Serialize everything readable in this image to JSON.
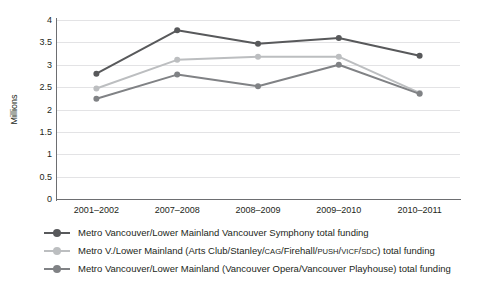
{
  "chart_data": {
    "type": "line",
    "title": "",
    "xlabel": "",
    "ylabel": "Millions",
    "ylim": [
      0,
      4
    ],
    "ytick_values": [
      4,
      3.5,
      3,
      2.5,
      2,
      1.5,
      1,
      0.5,
      0
    ],
    "ytick_labels": [
      "4",
      "3.5",
      "3",
      "2.5",
      "2",
      "1.5",
      "1",
      "0.5",
      "0"
    ],
    "grid": true,
    "legend_position": "below",
    "categories": [
      "2001–2002",
      "2007–2008",
      "2008–2009",
      "2009–2010",
      "2010–2011"
    ],
    "series": [
      {
        "name": "Metro Vancouver/Lower Mainland Vancouver Symphony total funding",
        "color": "#58595b",
        "values": [
          2.8,
          3.77,
          3.47,
          3.6,
          3.2
        ]
      },
      {
        "name": "Metro V./Lower Mainland (Arts Club/Stanley/CAG/Firehall/PUSH/VICF/SDC) total funding",
        "color": "#bcbec0",
        "values": [
          2.47,
          3.11,
          3.18,
          3.18,
          2.37
        ]
      },
      {
        "name": "Metro Vancouver/Lower Mainland (Vancouver Opera/Vancouver Playhouse) total funding",
        "color": "#808285",
        "values": [
          2.24,
          2.78,
          2.52,
          3.0,
          2.35
        ]
      }
    ]
  },
  "legend": {
    "entries": [
      {
        "prefix": "Metro Vancouver/Lower Mainland Vancouver Symphony total funding",
        "color": "#58595b"
      },
      {
        "prefix": "Metro V./Lower Mainland (Arts Club/Stanley/",
        "a1": "CAG",
        "mid1": "/Firehall/",
        "a2": "PUSH",
        "mid2": "/",
        "a3": "VICF",
        "mid3": "/",
        "a4": "SDC",
        "suffix": ") total funding",
        "color": "#bcbec0"
      },
      {
        "prefix": "Metro Vancouver/Lower Mainland (Vancouver Opera/Vancouver Playhouse) total funding",
        "color": "#808285"
      }
    ]
  },
  "axis": {
    "y_title": "Millions"
  }
}
